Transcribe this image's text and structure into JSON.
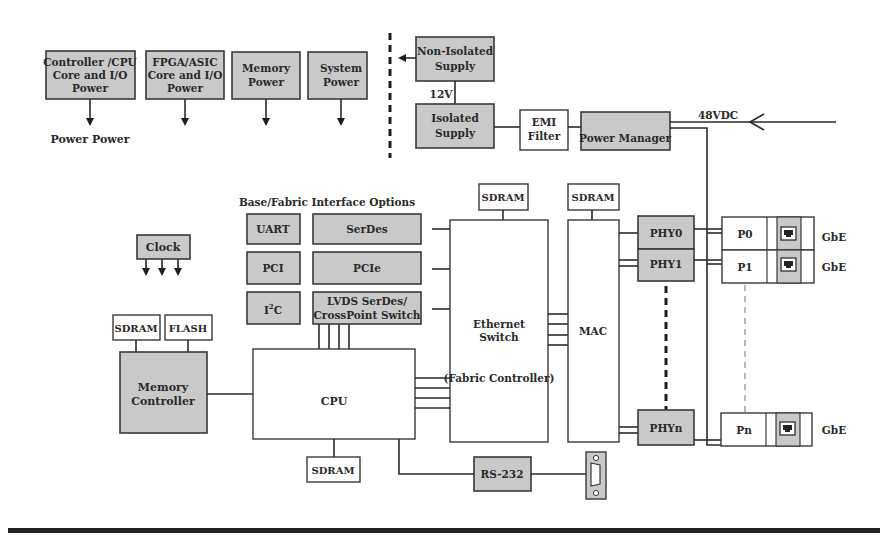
{
  "power_rails": [
    {
      "label": [
        "Controller /CPU",
        "Core and I/O",
        "Power"
      ]
    },
    {
      "label": [
        "FPGA/ASIC",
        "Core and I/O",
        "Power"
      ]
    },
    {
      "label": [
        "Memory",
        "Power"
      ]
    },
    {
      "label": [
        "System",
        "Power"
      ]
    }
  ],
  "power_caption": "Power Power",
  "supplies": {
    "non_isolated": [
      "Non-Isolated",
      "Supply"
    ],
    "isolated": [
      "Isolated",
      "Supply"
    ],
    "voltage_12v": "12V",
    "emi_filter": [
      "EMI",
      "Filter"
    ],
    "power_manager": "Power Manager",
    "input_48vdc": "48VDC"
  },
  "interface_options": {
    "title": "Base/Fabric Interface Options",
    "items": [
      "UART",
      "SerDes",
      "PCI",
      "PCIe",
      "I2C",
      "LVDS SerDes/",
      "CrossPoint Switch"
    ],
    "i2c_base": "I",
    "i2c_sup": "2",
    "i2c_tail": "C"
  },
  "clock": "Clock",
  "memory": {
    "sdram": "SDRAM",
    "flash": "FLASH",
    "controller": [
      "Memory",
      "Controller"
    ]
  },
  "cpu": {
    "label": "CPU",
    "sdram": "SDRAM"
  },
  "switch": {
    "sdram": "SDRAM",
    "label": [
      "Ethernet",
      "Switch"
    ],
    "sub": "(Fabric Controller)"
  },
  "mac": {
    "sdram": "SDRAM",
    "label": "MAC"
  },
  "phys": [
    "PHY0",
    "PHY1",
    "PHYn"
  ],
  "ports": [
    {
      "name": "P0",
      "type": "GbE"
    },
    {
      "name": "P1",
      "type": "GbE"
    },
    {
      "name": "Pn",
      "type": "GbE"
    }
  ],
  "serial": {
    "label": "RS-232"
  }
}
